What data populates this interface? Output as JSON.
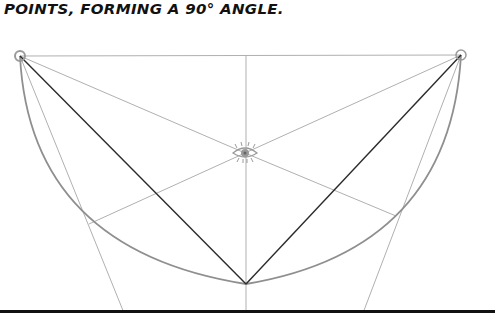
{
  "caption": {
    "text": "POINTS, FORMING A 90° ANGLE."
  },
  "diagram": {
    "points": {
      "top_left": [
        20,
        56
      ],
      "top_right": [
        461,
        55
      ],
      "eye": [
        245,
        153
      ],
      "bottom_vertex": [
        246,
        284
      ]
    },
    "colors": {
      "construction_line": "#a8a8a8",
      "arc": "#8f8f8f",
      "angle_lines": "#2a2a2a",
      "point_ring": "#9a9a9a"
    }
  }
}
